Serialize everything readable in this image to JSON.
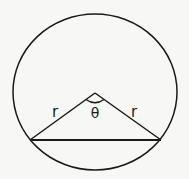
{
  "diagram": {
    "type": "circle-with-inscribed-isosceles-triangle",
    "circle": {
      "cx": 95,
      "cy": 92,
      "r": 80
    },
    "apex": {
      "x": 95,
      "y": 93
    },
    "chord": {
      "x1": 30,
      "y1": 140,
      "x2": 161,
      "y2": 140
    },
    "labels": {
      "left_side": "r",
      "right_side": "r",
      "angle": "θ"
    },
    "stroke_color": "#1a1a1a",
    "background_color": "#f7f7f5"
  }
}
